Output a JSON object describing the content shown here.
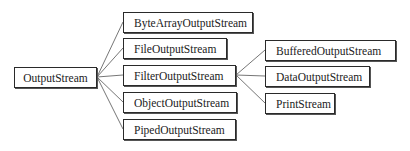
{
  "diagram": {
    "type": "class-hierarchy-tree",
    "root": {
      "id": "outputstream",
      "label": "OutputStream",
      "box": {
        "x": 14,
        "y": 67,
        "w": 83,
        "h": 21
      }
    },
    "level1": [
      {
        "id": "bytearray",
        "label": "ByteArrayOutputStream",
        "box": {
          "x": 123,
          "y": 12,
          "w": 130,
          "h": 21
        }
      },
      {
        "id": "file",
        "label": "FileOutputStream",
        "box": {
          "x": 123,
          "y": 38,
          "w": 104,
          "h": 21
        }
      },
      {
        "id": "filter",
        "label": "FilterOutputStream",
        "box": {
          "x": 123,
          "y": 65,
          "w": 113,
          "h": 21
        }
      },
      {
        "id": "object",
        "label": "ObjectOutputStream",
        "box": {
          "x": 123,
          "y": 92,
          "w": 114,
          "h": 21
        }
      },
      {
        "id": "piped",
        "label": "PipedOutputStream",
        "box": {
          "x": 123,
          "y": 119,
          "w": 113,
          "h": 21
        }
      }
    ],
    "level2": [
      {
        "id": "buffered",
        "label": "BufferedOutputStream",
        "parent": "filter",
        "box": {
          "x": 265,
          "y": 40,
          "w": 131,
          "h": 21
        }
      },
      {
        "id": "data",
        "label": "DataOutputStream",
        "parent": "filter",
        "box": {
          "x": 265,
          "y": 66,
          "w": 105,
          "h": 21
        }
      },
      {
        "id": "print",
        "label": "PrintStream",
        "parent": "filter",
        "box": {
          "x": 265,
          "y": 93,
          "w": 70,
          "h": 21
        }
      }
    ],
    "edges": [
      {
        "from": "outputstream",
        "to": "bytearray"
      },
      {
        "from": "outputstream",
        "to": "file"
      },
      {
        "from": "outputstream",
        "to": "filter"
      },
      {
        "from": "outputstream",
        "to": "object"
      },
      {
        "from": "outputstream",
        "to": "piped"
      },
      {
        "from": "filter",
        "to": "buffered"
      },
      {
        "from": "filter",
        "to": "data"
      },
      {
        "from": "filter",
        "to": "print"
      }
    ],
    "colors": {
      "border": "#2a2a2a",
      "edge": "#666666",
      "text": "#222222",
      "background": "#ffffff"
    }
  }
}
